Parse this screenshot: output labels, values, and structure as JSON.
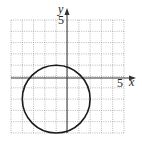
{
  "chart_data": {
    "type": "line",
    "title": "",
    "xlabel": "x",
    "ylabel": "y",
    "xlim": [
      -5,
      5
    ],
    "ylim": [
      -5,
      5
    ],
    "grid": true,
    "tick_labels": {
      "x": [
        "5"
      ],
      "y": [
        "5"
      ]
    },
    "series": [
      {
        "name": "circle",
        "shape": "circle",
        "center": [
          -1,
          -2
        ],
        "radius": 3,
        "equation": "(x+1)^2 + (y+2)^2 = 9"
      }
    ]
  },
  "labels": {
    "x_axis": "x",
    "y_axis": "y",
    "x_tick": "5",
    "y_tick": "5"
  }
}
